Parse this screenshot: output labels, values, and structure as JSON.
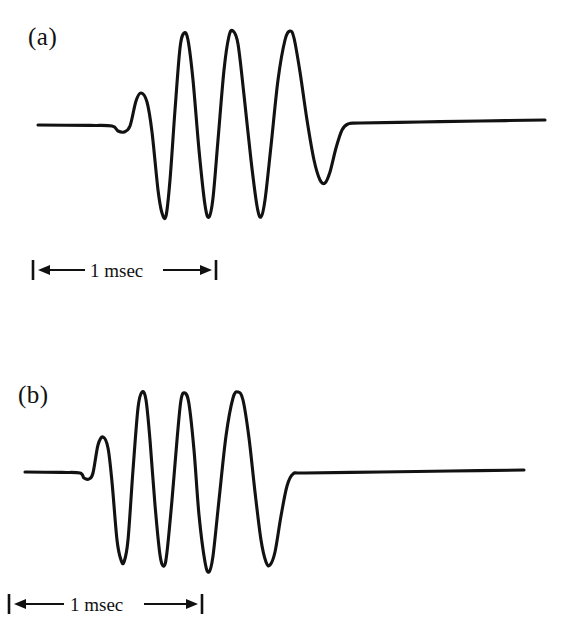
{
  "figure": {
    "background_color": "#ffffff",
    "trace_color": "#121212",
    "panels": [
      {
        "id": "a",
        "label": "(a)",
        "scalebar": {
          "text": "1 msec",
          "unit": "msec",
          "value": 1
        }
      },
      {
        "id": "b",
        "label": "(b)",
        "scalebar": {
          "text": "1 msec",
          "unit": "msec",
          "value": 1
        }
      }
    ]
  },
  "chart_data": {
    "type": "line",
    "title": "",
    "xlabel": "",
    "ylabel": "",
    "grid": false,
    "legend": false,
    "annotations": [
      "(a)",
      "(b)",
      "1 msec",
      "1 msec"
    ],
    "scalebar_msec": 1,
    "series": [
      {
        "name": "(a)",
        "baseline_y": 125,
        "x_start": 38,
        "x_end": 545,
        "onset_x": 118,
        "cycles": 5,
        "points": [
          [
            38,
            125
          ],
          [
            90,
            125.4
          ],
          [
            112,
            126
          ],
          [
            118,
            131
          ],
          [
            124,
            132
          ],
          [
            130,
            126
          ],
          [
            136,
            101
          ],
          [
            141,
            93
          ],
          [
            147,
            102
          ],
          [
            152,
            132
          ],
          [
            158,
            190
          ],
          [
            162,
            213
          ],
          [
            166,
            216
          ],
          [
            170,
            180
          ],
          [
            175,
            110
          ],
          [
            180,
            48
          ],
          [
            184,
            33
          ],
          [
            188,
            40
          ],
          [
            193,
            80
          ],
          [
            199,
            150
          ],
          [
            205,
            205
          ],
          [
            209,
            217
          ],
          [
            213,
            198
          ],
          [
            218,
            140
          ],
          [
            224,
            70
          ],
          [
            229,
            36
          ],
          [
            233,
            31
          ],
          [
            238,
            44
          ],
          [
            244,
            95
          ],
          [
            251,
            160
          ],
          [
            257,
            206
          ],
          [
            261,
            217
          ],
          [
            265,
            200
          ],
          [
            271,
            146
          ],
          [
            278,
            80
          ],
          [
            285,
            40
          ],
          [
            290,
            31
          ],
          [
            294,
            38
          ],
          [
            300,
            72
          ],
          [
            307,
            120
          ],
          [
            314,
            160
          ],
          [
            320,
            180
          ],
          [
            325,
            183
          ],
          [
            330,
            172
          ],
          [
            336,
            148
          ],
          [
            342,
            130
          ],
          [
            348,
            124
          ],
          [
            360,
            123
          ],
          [
            420,
            122
          ],
          [
            480,
            121
          ],
          [
            545,
            120
          ]
        ]
      },
      {
        "name": "(b)",
        "baseline_y": 472,
        "x_start": 25,
        "x_end": 524,
        "onset_x": 84,
        "cycles": 5,
        "points": [
          [
            25,
            472
          ],
          [
            62,
            472.4
          ],
          [
            80,
            473
          ],
          [
            84,
            478
          ],
          [
            89,
            479
          ],
          [
            93,
            473
          ],
          [
            98,
            445
          ],
          [
            103,
            437
          ],
          [
            108,
            448
          ],
          [
            112,
            482
          ],
          [
            117,
            540
          ],
          [
            121,
            560
          ],
          [
            124,
            562
          ],
          [
            128,
            540
          ],
          [
            133,
            470
          ],
          [
            138,
            408
          ],
          [
            142,
            392
          ],
          [
            146,
            400
          ],
          [
            150,
            440
          ],
          [
            155,
            505
          ],
          [
            160,
            555
          ],
          [
            164,
            566
          ],
          [
            167,
            552
          ],
          [
            172,
            500
          ],
          [
            177,
            440
          ],
          [
            181,
            400
          ],
          [
            185,
            393
          ],
          [
            189,
            404
          ],
          [
            194,
            450
          ],
          [
            199,
            515
          ],
          [
            205,
            562
          ],
          [
            209,
            572
          ],
          [
            213,
            556
          ],
          [
            219,
            500
          ],
          [
            226,
            436
          ],
          [
            233,
            398
          ],
          [
            238,
            392
          ],
          [
            243,
            400
          ],
          [
            249,
            438
          ],
          [
            255,
            492
          ],
          [
            261,
            540
          ],
          [
            266,
            562
          ],
          [
            270,
            565
          ],
          [
            275,
            552
          ],
          [
            281,
            516
          ],
          [
            287,
            486
          ],
          [
            293,
            474
          ],
          [
            305,
            473
          ],
          [
            380,
            472
          ],
          [
            450,
            471
          ],
          [
            524,
            470
          ]
        ]
      }
    ]
  }
}
